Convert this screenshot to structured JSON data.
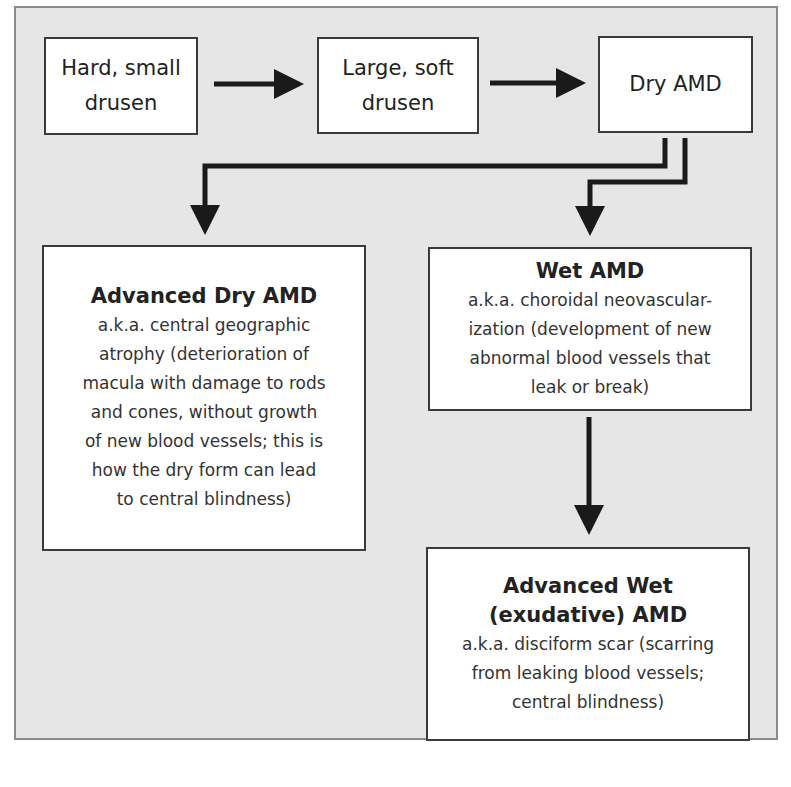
{
  "diagram": {
    "nodes": {
      "hard_drusen": {
        "label_line1": "Hard, small",
        "label_line2": "drusen"
      },
      "soft_drusen": {
        "label_line1": "Large, soft",
        "label_line2": "drusen"
      },
      "dry_amd": {
        "label": "Dry AMD"
      },
      "advanced_dry": {
        "title": "Advanced Dry AMD",
        "desc_lines": [
          "a.k.a. central geographic",
          "atrophy (deterioration of",
          "macula with damage to rods",
          "and cones, without growth",
          "of new blood vessels; this is",
          "how the dry form can lead",
          "to central blindness)"
        ]
      },
      "wet_amd": {
        "title": "Wet AMD",
        "desc_lines": [
          "a.k.a. choroidal neovascular-",
          "ization (development of new",
          "abnormal blood vessels that",
          "leak or break)"
        ]
      },
      "advanced_wet": {
        "title_line1": "Advanced Wet",
        "title_line2": "(exudative) AMD",
        "desc_lines": [
          "a.k.a. disciform scar (scarring",
          "from leaking blood vessels;",
          "central blindness)"
        ]
      }
    },
    "edges": [
      {
        "from": "Hard, small drusen",
        "to": "Large, soft drusen"
      },
      {
        "from": "Large, soft drusen",
        "to": "Dry AMD"
      },
      {
        "from": "Dry AMD",
        "to": "Advanced Dry AMD"
      },
      {
        "from": "Dry AMD",
        "to": "Wet AMD"
      },
      {
        "from": "Wet AMD",
        "to": "Advanced Wet (exudative) AMD"
      }
    ],
    "colors": {
      "background": "#e6e6e6",
      "box_fill": "#ffffff",
      "stroke": "#1a1a1a"
    }
  }
}
